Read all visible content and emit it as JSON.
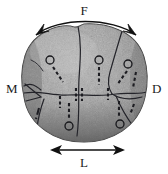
{
  "figure": {
    "background_color": "#ffffff",
    "specimen": {
      "name": "specimen-blob",
      "fill_color": "#9a9a9a",
      "shadow_color": "#6e6e6e",
      "highlight_color": "#c3c3c3",
      "outline_color": "#3a3a3a"
    }
  },
  "labels": {
    "top": "F",
    "left": "M",
    "right": "D",
    "bottom": "L"
  },
  "arrows": {
    "top": {
      "name": "curved-double-arrow",
      "label": "F",
      "style": "curved",
      "heads": "both",
      "color": "#111111"
    },
    "bottom": {
      "name": "straight-double-arrow",
      "label": "L",
      "style": "straight",
      "heads": "both",
      "color": "#111111"
    }
  },
  "markers": {
    "circles": [
      {
        "id": "circle-1",
        "cx": 50,
        "cy": 60,
        "r": 4
      },
      {
        "id": "circle-2",
        "cx": 99,
        "cy": 60,
        "r": 4
      },
      {
        "id": "circle-3",
        "cx": 128,
        "cy": 64,
        "r": 4
      },
      {
        "id": "circle-4",
        "cx": 69,
        "cy": 126,
        "r": 4
      },
      {
        "id": "circle-5",
        "cx": 120,
        "cy": 124,
        "r": 4
      }
    ],
    "dashed_ticks": 9,
    "ridge_lines": 5
  }
}
